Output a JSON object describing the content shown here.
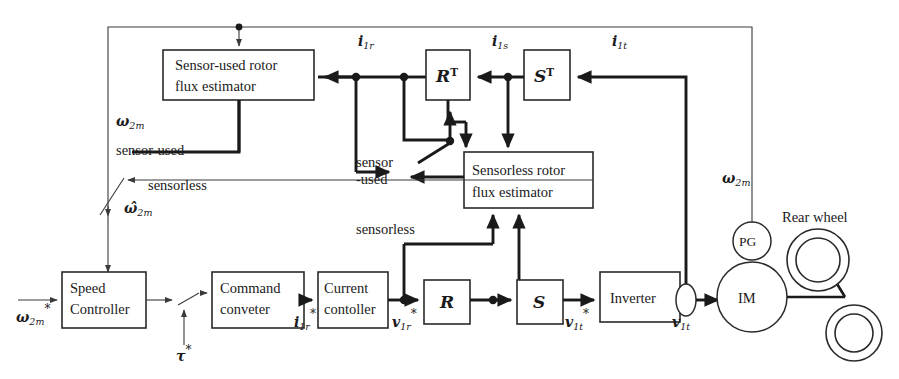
{
  "diagram": {
    "blocks": {
      "sensor_used_estimator": {
        "line1": "Sensor-used rotor",
        "line2": "flux estimator"
      },
      "sensorless_estimator": {
        "line1": "Sensorless rotor",
        "line2": "flux estimator"
      },
      "speed_controller": {
        "line1": "Speed",
        "line2": "Controller"
      },
      "command_converter": {
        "line1": "Command",
        "line2": "conveter"
      },
      "current_controller": {
        "line1": "Current",
        "line2": "contoller"
      },
      "inverter": {
        "label": "Inverter"
      },
      "rt": {
        "base": "R",
        "sup": "T"
      },
      "st": {
        "base": "S",
        "sup": "T"
      },
      "r": {
        "base": "R"
      },
      "s": {
        "base": "S"
      },
      "im": {
        "label": "IM"
      },
      "pg": {
        "label": "PG"
      }
    },
    "signals": {
      "i1r": {
        "base": "i",
        "sub": "1r"
      },
      "i1s": {
        "base": "i",
        "sub": "1s"
      },
      "i1t": {
        "base": "i",
        "sub": "1t"
      },
      "i1r_ref": {
        "base": "i",
        "sub": "1r",
        "sup": "*"
      },
      "v1r_ref": {
        "base": "v",
        "sub": "1r",
        "sup": "*"
      },
      "v1t_ref": {
        "base": "v",
        "sub": "1t",
        "sup": "*"
      },
      "v1t": {
        "base": "v",
        "sub": "1t"
      },
      "w2m_ref": {
        "base": "ω",
        "sub": "2m",
        "sup": "*"
      },
      "w2m_top": {
        "base": "ω",
        "sub": "2m"
      },
      "w2m_right": {
        "base": "ω",
        "sub": "2m"
      },
      "w2m_hat": {
        "base": "ω̂",
        "sub": "2m"
      },
      "tau_ref": {
        "base": "τ",
        "sup": "*"
      }
    },
    "labels": {
      "sensor_used_left": "sensor-used",
      "sensorless_left": "sensorless",
      "sensor_sw_line1": "sensor",
      "sensor_sw_line2": "-used",
      "sensorless_sw": "sensorless",
      "rear_wheel": "Rear wheel"
    },
    "colors": {
      "line": "#1a1a1a",
      "thin_line": "#3a3a3a",
      "background": "#ffffff"
    }
  }
}
